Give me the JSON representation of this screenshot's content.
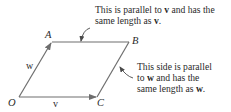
{
  "diagram": {
    "points": {
      "O": {
        "label": "O",
        "x": 19,
        "y": 97
      },
      "A": {
        "label": "A",
        "x": 52,
        "y": 42
      },
      "B": {
        "label": "B",
        "x": 129,
        "y": 42
      },
      "C": {
        "label": "C",
        "x": 97,
        "y": 97
      }
    },
    "vectors": {
      "v": {
        "label": "v",
        "from": "O",
        "to": "C"
      },
      "w": {
        "label": "w",
        "from": "O",
        "to": "A"
      }
    },
    "annotations": {
      "top": {
        "line1": "This is parallel to ",
        "bold1": "v",
        "line1b": " and has the",
        "line2": "same length as ",
        "bold2": "v",
        "line2b": "."
      },
      "right": {
        "line1": "This side is parallel",
        "line2a": "to ",
        "bold1": "w",
        "line2b": " and has the",
        "line3a": "same length as ",
        "bold2": "w",
        "line3b": "."
      }
    },
    "colors": {
      "line": "#6e6e6e",
      "text": "#2a2a2a"
    }
  }
}
